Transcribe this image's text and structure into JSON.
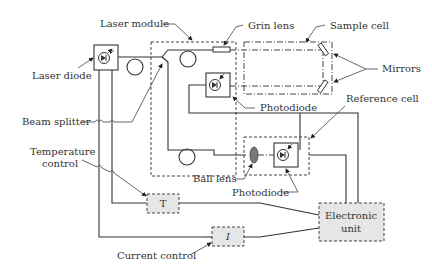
{
  "diagram": {
    "labels": {
      "laser_module": "Laser module",
      "grin_lens": "Grin lens",
      "sample_cell": "Sample cell",
      "laser_diode": "Laser diode",
      "mirrors": "Mirrors",
      "photodiode_top": "Photodiode",
      "reference_cell": "Reference cell",
      "beam_splitter": "Beam splitter",
      "temperature_control_line1": "Temperature",
      "temperature_control_line2": "control",
      "ball_lens": "Ball lens",
      "photodiode_bottom": "Photodiode",
      "current_control": "Current control"
    },
    "boxes": {
      "temperature_box": "T",
      "current_box": "I",
      "electronic_unit_line1": "Electronic",
      "electronic_unit_line2": "unit"
    },
    "colors": {
      "line": "#333333",
      "box_fill": "#e6e6e6",
      "ball_lens_fill": "#777777"
    }
  }
}
